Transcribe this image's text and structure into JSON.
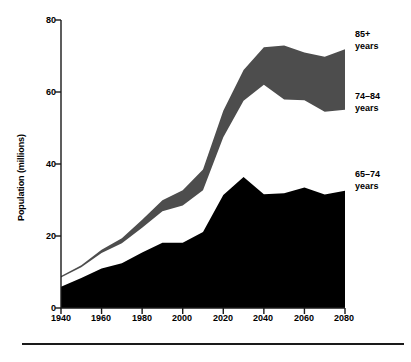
{
  "chart_data": {
    "type": "area",
    "stacked": true,
    "title": "",
    "subtitle": "",
    "xlabel": "",
    "ylabel": "Population (millions)",
    "xlim": [
      1940,
      2080
    ],
    "ylim": [
      0,
      80
    ],
    "yticks": [
      0,
      20,
      40,
      60,
      80
    ],
    "xticks": [
      1940,
      1960,
      1980,
      2000,
      2020,
      2040,
      2060,
      2080
    ],
    "xtick_labels": [
      "1940",
      "1960",
      "1980",
      "2000",
      "2020",
      "2040",
      "2060",
      "2080"
    ],
    "ytick_labels": [
      "0",
      "20",
      "40",
      "60",
      "80"
    ],
    "grid": false,
    "legend_position": "right-inline",
    "x": [
      1940,
      1950,
      1960,
      1970,
      1980,
      1990,
      2000,
      2010,
      2020,
      2030,
      2040,
      2050,
      2060,
      2070,
      2080
    ],
    "series": [
      {
        "name": "65–74 years",
        "color": "#000000",
        "values": [
          5.9,
          8.3,
          11.0,
          12.4,
          15.4,
          18.1,
          18.1,
          21.1,
          31.4,
          36.4,
          31.6,
          31.9,
          33.5,
          31.5,
          32.6
        ]
      },
      {
        "name": "74–84 years",
        "color": "#ffffff",
        "values": [
          2.6,
          3.0,
          4.3,
          5.6,
          6.9,
          8.8,
          10.4,
          11.6,
          16.0,
          21.2,
          30.4,
          26.0,
          24.2,
          23.0,
          22.5
        ]
      },
      {
        "name": "85+ years",
        "color": "#4d4d4d",
        "values": [
          0.4,
          0.6,
          0.9,
          1.4,
          2.2,
          3.0,
          4.2,
          5.8,
          7.4,
          8.5,
          10.4,
          15.0,
          13.3,
          15.3,
          16.8
        ]
      }
    ],
    "annotations": [
      {
        "label": "85+\nyears",
        "at_year": 2080
      },
      {
        "label": "74–84\nyears",
        "at_year": 2080
      },
      {
        "label": "65–74\nyears",
        "at_year": 2080
      }
    ]
  },
  "labels": {
    "ylabel": "Population (millions)",
    "series_85plus": "85+\nyears",
    "series_74_84": "74–84\nyears",
    "series_65_74": "65–74\nyears",
    "y0": "0",
    "y20": "20",
    "y40": "40",
    "y60": "60",
    "y80": "80",
    "x1940": "1940",
    "x1960": "1960",
    "x1980": "1980",
    "x2000": "2000",
    "x2020": "2020",
    "x2040": "2040",
    "x2060": "2060",
    "x2080": "2080"
  },
  "colors": {
    "band_dark": "#4d4d4d",
    "band_black": "#000000",
    "axis": "#1a1a1a",
    "background": "#ffffff"
  }
}
